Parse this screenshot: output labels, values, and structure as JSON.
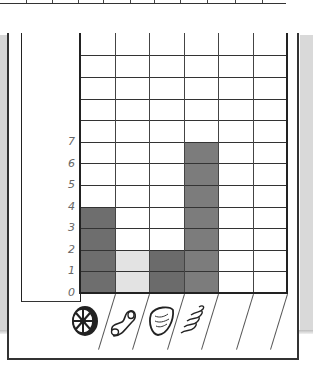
{
  "chart_data": {
    "type": "bar",
    "title": "",
    "xlabel": "Pasta shape",
    "ylabel": "",
    "categories": [
      "wagon-wheel",
      "elbow-macaroni",
      "shell",
      "rotini",
      "",
      ""
    ],
    "values": [
      4,
      2,
      2,
      7,
      0,
      0
    ],
    "bar_colors": [
      "#6e6e6e",
      "#e3e3e3",
      "#6b6b6b",
      "#7c7c7c",
      "#ffffff",
      "#ffffff"
    ],
    "y_ticks": [
      "0",
      "1",
      "2",
      "3",
      "4",
      "5",
      "6",
      "7"
    ],
    "ylim": [
      0,
      12
    ],
    "grid": true,
    "legend": "none"
  },
  "axis": {
    "y_labels": [
      "7",
      "6",
      "5",
      "4",
      "3",
      "2",
      "1",
      "0"
    ]
  },
  "icons": [
    "wagon-wheel-pasta-icon",
    "elbow-macaroni-icon",
    "shell-pasta-icon",
    "rotini-pasta-icon"
  ]
}
